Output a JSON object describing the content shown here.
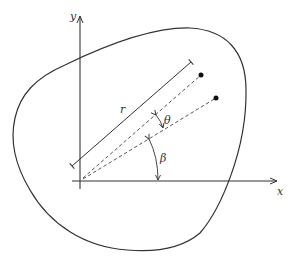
{
  "diagram": {
    "colors": {
      "stroke": "#333333",
      "dashed": "#555555",
      "background": "#ffffff"
    },
    "labels": {
      "x_axis": "x",
      "y_axis": "y",
      "radius": "r",
      "theta": "θ",
      "beta": "β"
    },
    "elements": {
      "region_boundary": "closed curve",
      "origin": [
        80,
        181
      ],
      "points": [
        {
          "name": "upper-point",
          "x": 201,
          "y": 75
        },
        {
          "name": "lower-point",
          "x": 216,
          "y": 98
        }
      ]
    }
  }
}
